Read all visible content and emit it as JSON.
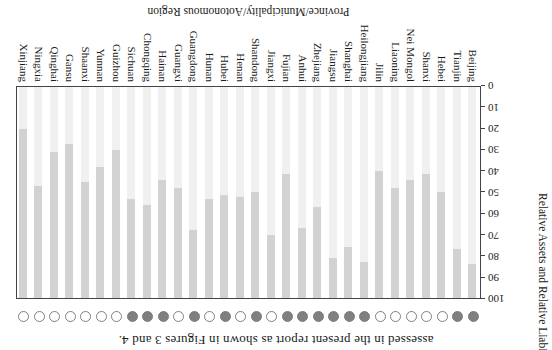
{
  "figure": {
    "caption_tail": "assessed in the present report as shown in Figures 3 and 4.",
    "x_axis_title": "Province/Municipality/Aotonomous Region",
    "y_axis_title": "Relative Assets and Relative Liabilities/%"
  },
  "colors": {
    "bar_light_segment": "#f0f0f0",
    "bar_dark_segment": "#d2d2d2",
    "marker_circle": "#7f7f7f",
    "axis_line": "#444444",
    "text": "#1a1a1a",
    "background": "#ffffff"
  },
  "chart_data": {
    "type": "bar",
    "stacked": true,
    "orientation": "vertical",
    "title": "",
    "xlabel": "Province/Municipality/Aotonomous Region",
    "ylabel": "Relative Assets and Relative Liabilities/%",
    "ylim": [
      0,
      100
    ],
    "yticks": [
      0,
      10,
      20,
      30,
      40,
      50,
      60,
      70,
      80,
      90,
      100
    ],
    "grid": false,
    "legend_position": "none",
    "categories": [
      "Beijing",
      "Tianjin",
      "Hebei",
      "Shanxi",
      "Nei Mongol",
      "Liaoning",
      "Jilin",
      "Heilongjiang",
      "Shanghai",
      "Jiangsu",
      "Zhejiang",
      "Anhui",
      "Fujian",
      "Jiangxi",
      "Shandong",
      "Henan",
      "Hubei",
      "Hunan",
      "Guangdong",
      "Guangxi",
      "Hainan",
      "Chongqing",
      "Sichuan",
      "Guizhou",
      "Yunnan",
      "Shaanxi",
      "Gansu",
      "Qinghai",
      "Ningxia",
      "Xinjiang"
    ],
    "series": [
      {
        "name": "lower light segment",
        "values": [
          84,
          77,
          50,
          41,
          44,
          48,
          40,
          83,
          76,
          81,
          57,
          67,
          41,
          70,
          50,
          52,
          51,
          53,
          68,
          48,
          44,
          56,
          53,
          30,
          38,
          45,
          27,
          31,
          47,
          20
        ]
      },
      {
        "name": "upper dark segment",
        "values": [
          16,
          23,
          50,
          59,
          56,
          52,
          60,
          17,
          24,
          19,
          43,
          33,
          59,
          30,
          50,
          48,
          49,
          47,
          32,
          52,
          56,
          44,
          47,
          70,
          62,
          55,
          73,
          69,
          53,
          80
        ]
      }
    ],
    "assessed_marker_filled": [
      true,
      true,
      false,
      false,
      false,
      false,
      false,
      true,
      true,
      true,
      true,
      true,
      true,
      false,
      true,
      false,
      true,
      false,
      true,
      false,
      true,
      true,
      true,
      false,
      false,
      false,
      false,
      false,
      false,
      false
    ]
  }
}
